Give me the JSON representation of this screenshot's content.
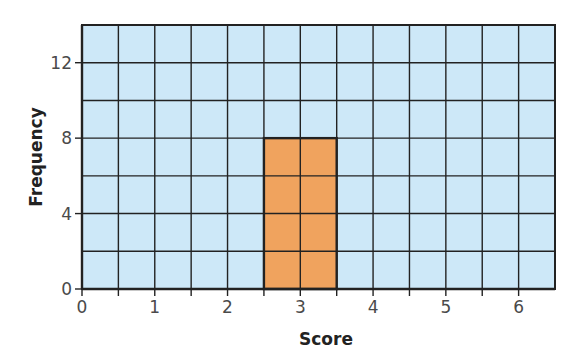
{
  "chart_data": {
    "type": "bar",
    "title": "",
    "xlabel": "Score",
    "ylabel": "Frequency",
    "categories": [
      "3"
    ],
    "x": [
      3
    ],
    "values": [
      8
    ],
    "bar_width": 1,
    "xlim": [
      0,
      6.5
    ],
    "ylim": [
      0,
      14
    ],
    "xticks": [
      0,
      1,
      2,
      3,
      4,
      5,
      6
    ],
    "yticks": [
      0,
      4,
      8,
      12
    ],
    "grid": {
      "on": true,
      "x_step": 0.5,
      "y_step": 2
    },
    "legend": null
  },
  "colors": {
    "background": "#cde8f8",
    "bar": "#f0a35e",
    "grid": "#222222",
    "axis": "#222222"
  }
}
